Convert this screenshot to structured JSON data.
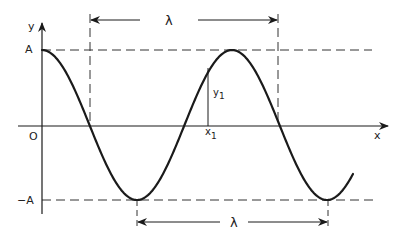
{
  "diagram": {
    "labels": {
      "y_axis": "y",
      "x_axis": "x",
      "origin": "O",
      "amplitude_pos": "A",
      "amplitude_neg": "−A",
      "wavelength_top": "λ",
      "wavelength_bottom": "λ",
      "point_y": "y",
      "point_y_sub": "1",
      "point_x": "x",
      "point_x_sub": "1"
    },
    "curve": {
      "type": "cosine",
      "description": "y = A cos(2πx/λ), shown for about 1.6 wavelengths",
      "start_phase": "peak at x = 0"
    },
    "colors": {
      "line": "#1a1a1a",
      "dashed": "#333333",
      "background": "#ffffff"
    }
  }
}
